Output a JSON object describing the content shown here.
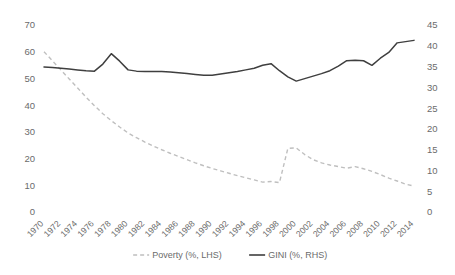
{
  "chart_data": {
    "type": "line",
    "title": "",
    "xlabel": "",
    "grid": false,
    "legend_position": "bottom",
    "x": [
      1970,
      1971,
      1972,
      1973,
      1974,
      1975,
      1976,
      1977,
      1978,
      1979,
      1980,
      1981,
      1982,
      1983,
      1984,
      1985,
      1986,
      1987,
      1988,
      1989,
      1990,
      1991,
      1992,
      1993,
      1994,
      1995,
      1996,
      1997,
      1998,
      1999,
      2000,
      2001,
      2002,
      2003,
      2004,
      2005,
      2006,
      2007,
      2008,
      2009,
      2010,
      2011,
      2012,
      2013,
      2014
    ],
    "xtick_labels": [
      "1970",
      "1972",
      "1974",
      "1976",
      "1978",
      "1980",
      "1982",
      "1984",
      "1986",
      "1988",
      "1990",
      "1992",
      "1994",
      "1996",
      "1998",
      "2000",
      "2002",
      "2004",
      "2006",
      "2008",
      "2010",
      "2012",
      "2014"
    ],
    "xlim": [
      1970,
      2014
    ],
    "left_axis": {
      "label": "Poverty (%, LHS)",
      "ylim": [
        0,
        70
      ],
      "yticks": [
        0,
        10,
        20,
        30,
        40,
        50,
        60,
        70
      ],
      "ytick_labels": [
        "0",
        "10",
        "20",
        "30",
        "40",
        "50",
        "60",
        "70"
      ]
    },
    "right_axis": {
      "label": "GINI (%, RHS)",
      "ylim": [
        0,
        45
      ],
      "yticks": [
        0,
        5,
        10,
        15,
        20,
        25,
        30,
        35,
        40,
        45
      ],
      "ytick_labels": [
        "0",
        "5",
        "10",
        "15",
        "20",
        "25",
        "30",
        "35",
        "40",
        "45"
      ]
    },
    "series": [
      {
        "name": "Poverty (%, LHS)",
        "axis": "left",
        "style": "dashed",
        "color": "#bfbfbf",
        "values": [
          60.0,
          56.6,
          53.2,
          49.8,
          46.4,
          43.0,
          39.8,
          36.8,
          34.2,
          31.8,
          29.6,
          27.8,
          26.2,
          24.7,
          23.3,
          22.0,
          20.8,
          19.6,
          18.4,
          17.3,
          16.3,
          15.4,
          14.5,
          13.6,
          12.8,
          12.0,
          11.2,
          11.4,
          11.0,
          23.8,
          24.0,
          21.5,
          19.6,
          18.4,
          17.6,
          17.0,
          16.4,
          17.0,
          16.2,
          15.2,
          14.0,
          12.7,
          11.6,
          10.4,
          9.7
        ]
      },
      {
        "name": "GINI (%, RHS)",
        "axis": "right",
        "style": "solid",
        "color": "#3f3f3f",
        "values": [
          34.9,
          34.8,
          34.6,
          34.4,
          34.2,
          34.0,
          33.9,
          35.6,
          38.1,
          36.3,
          34.2,
          33.9,
          33.8,
          33.8,
          33.8,
          33.7,
          33.5,
          33.3,
          33.1,
          32.9,
          32.9,
          33.2,
          33.5,
          33.8,
          34.2,
          34.6,
          35.3,
          35.7,
          34.0,
          32.5,
          31.5,
          32.1,
          32.7,
          33.3,
          34.0,
          35.1,
          36.4,
          36.5,
          36.4,
          35.3,
          37.0,
          38.4,
          40.7,
          41.0,
          41.3
        ]
      }
    ]
  },
  "legend": {
    "items": [
      {
        "label": "Poverty (%, LHS)",
        "color": "#bfbfbf",
        "style": "dashed"
      },
      {
        "label": "GINI (%, RHS)",
        "color": "#3f3f3f",
        "style": "solid"
      }
    ]
  }
}
